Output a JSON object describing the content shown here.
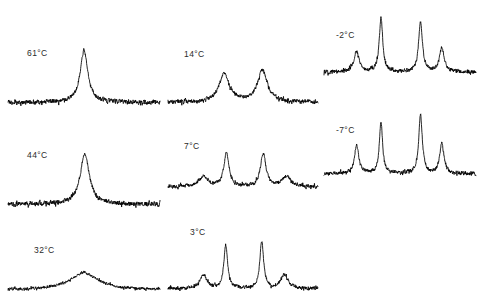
{
  "figure": {
    "type": "variable-temperature-nmr-spectra",
    "background_color": "#ffffff",
    "trace_color": "#000000",
    "label_color": "#2a2a2a",
    "columns": 3,
    "width": 479,
    "height": 303
  },
  "chart_data": {
    "type": "line",
    "title": "",
    "subtitle": "",
    "xlabel": "",
    "ylabel": "",
    "grid": false,
    "legend": "none",
    "axis_visible": false,
    "x": [
      0,
      1
    ],
    "xlim": [
      0,
      1
    ],
    "ylim": [
      0,
      1
    ],
    "series": [
      {
        "name": "61°C",
        "label": "61°C",
        "temperature_c": 61,
        "column": 1,
        "row": 1,
        "noise_amplitude": 0.055,
        "baseline": 0.1,
        "peaks": [
          {
            "center": 0.5,
            "height": 0.92,
            "width": 0.042
          }
        ]
      },
      {
        "name": "44°C",
        "label": "44°C",
        "temperature_c": 44,
        "column": 1,
        "row": 2,
        "noise_amplitude": 0.055,
        "baseline": 0.1,
        "peaks": [
          {
            "center": 0.505,
            "height": 0.9,
            "width": 0.05
          }
        ]
      },
      {
        "name": "32°C",
        "label": "32°C",
        "temperature_c": 32,
        "column": 1,
        "row": 3,
        "noise_amplitude": 0.05,
        "baseline": 0.1,
        "peaks": [
          {
            "center": 0.5,
            "height": 0.42,
            "width": 0.155
          }
        ]
      },
      {
        "name": "14°C",
        "label": "14°C",
        "temperature_c": 14,
        "column": 2,
        "row": 1,
        "noise_amplitude": 0.05,
        "baseline": 0.1,
        "peaks": [
          {
            "center": 0.375,
            "height": 0.5,
            "width": 0.058
          },
          {
            "center": 0.63,
            "height": 0.56,
            "width": 0.055
          }
        ]
      },
      {
        "name": "7°C",
        "label": "7°C",
        "temperature_c": 7,
        "column": 2,
        "row": 2,
        "noise_amplitude": 0.05,
        "baseline": 0.1,
        "peaks": [
          {
            "center": 0.235,
            "height": 0.2,
            "width": 0.05
          },
          {
            "center": 0.39,
            "height": 0.68,
            "width": 0.028
          },
          {
            "center": 0.635,
            "height": 0.66,
            "width": 0.03
          },
          {
            "center": 0.79,
            "height": 0.2,
            "width": 0.05
          }
        ]
      },
      {
        "name": "3°C",
        "label": "3°C",
        "temperature_c": 3,
        "column": 2,
        "row": 3,
        "noise_amplitude": 0.048,
        "baseline": 0.1,
        "peaks": [
          {
            "center": 0.235,
            "height": 0.26,
            "width": 0.038
          },
          {
            "center": 0.385,
            "height": 0.83,
            "width": 0.021
          },
          {
            "center": 0.625,
            "height": 0.9,
            "width": 0.021
          },
          {
            "center": 0.775,
            "height": 0.27,
            "width": 0.038
          }
        ]
      },
      {
        "name": "-2°C",
        "label": "-2°C",
        "temperature_c": -2,
        "column": 3,
        "row": 1,
        "noise_amplitude": 0.045,
        "baseline": 0.1,
        "peaks": [
          {
            "center": 0.215,
            "height": 0.34,
            "width": 0.028
          },
          {
            "center": 0.375,
            "height": 0.93,
            "width": 0.019
          },
          {
            "center": 0.635,
            "height": 0.86,
            "width": 0.021
          },
          {
            "center": 0.775,
            "height": 0.41,
            "width": 0.026
          }
        ]
      },
      {
        "name": "-7°C",
        "label": "-7°C",
        "temperature_c": -7,
        "column": 3,
        "row": 2,
        "noise_amplitude": 0.045,
        "baseline": 0.1,
        "peaks": [
          {
            "center": 0.215,
            "height": 0.48,
            "width": 0.023
          },
          {
            "center": 0.375,
            "height": 0.86,
            "width": 0.018
          },
          {
            "center": 0.635,
            "height": 0.98,
            "width": 0.02
          },
          {
            "center": 0.775,
            "height": 0.5,
            "width": 0.023
          }
        ]
      }
    ]
  },
  "panels": [
    {
      "id": "panel-61c",
      "label": "61°C",
      "series_index": 0,
      "left": 8,
      "top": 50,
      "width": 152,
      "height": 58,
      "label_left": 27,
      "label_top": 49
    },
    {
      "id": "panel-44c",
      "label": "44°C",
      "series_index": 1,
      "left": 8,
      "top": 152,
      "width": 152,
      "height": 58,
      "label_left": 27,
      "label_top": 151
    },
    {
      "id": "panel-32c",
      "label": "32°C",
      "series_index": 2,
      "left": 8,
      "top": 252,
      "width": 152,
      "height": 42,
      "label_left": 34,
      "label_top": 246
    },
    {
      "id": "panel-14c",
      "label": "14°C",
      "series_index": 3,
      "left": 168,
      "top": 50,
      "width": 150,
      "height": 58,
      "label_left": 184,
      "label_top": 50
    },
    {
      "id": "panel-7c",
      "label": "7°C",
      "series_index": 4,
      "left": 168,
      "top": 140,
      "width": 150,
      "height": 52,
      "label_left": 184,
      "label_top": 142
    },
    {
      "id": "panel-3c",
      "label": "3°C",
      "series_index": 5,
      "left": 168,
      "top": 240,
      "width": 150,
      "height": 54,
      "label_left": 190,
      "label_top": 228
    },
    {
      "id": "panel-m2c",
      "label": "-2°C",
      "series_index": 6,
      "left": 324,
      "top": 18,
      "width": 152,
      "height": 60,
      "label_left": 336,
      "label_top": 31
    },
    {
      "id": "panel-m7c",
      "label": "-7°C",
      "series_index": 7,
      "left": 324,
      "top": 118,
      "width": 152,
      "height": 62,
      "label_left": 336,
      "label_top": 126
    }
  ]
}
